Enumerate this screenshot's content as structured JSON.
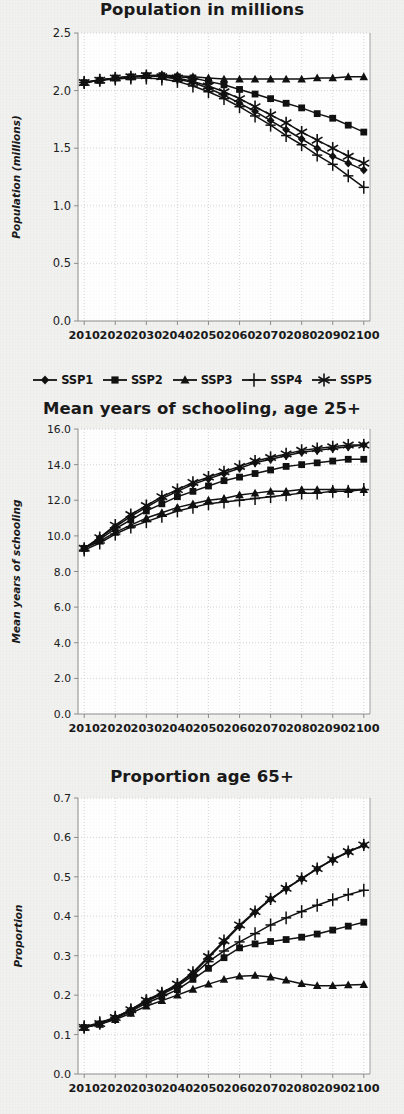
{
  "figure": {
    "background_color": "#f1f1f0",
    "ink_color": "#111111",
    "grid_color": "#c9c9c9",
    "axis_color": "#8d8d8d"
  },
  "legend": {
    "position": "below-first-chart",
    "entries": [
      {
        "label": "SSP1",
        "marker": "diamond"
      },
      {
        "label": "SSP2",
        "marker": "square"
      },
      {
        "label": "SSP3",
        "marker": "triangle"
      },
      {
        "label": "SSP4",
        "marker": "plus"
      },
      {
        "label": "SSP5",
        "marker": "asterisk"
      }
    ]
  },
  "chart_data": [
    {
      "type": "line",
      "title": "Population in millions",
      "xlabel": "",
      "ylabel": "Population (millions)",
      "x": [
        2010,
        2015,
        2020,
        2025,
        2030,
        2035,
        2040,
        2045,
        2050,
        2055,
        2060,
        2065,
        2070,
        2075,
        2080,
        2085,
        2090,
        2095,
        2100
      ],
      "xticks": [
        2010,
        2020,
        2030,
        2040,
        2050,
        2060,
        2070,
        2080,
        2090,
        2100
      ],
      "xlim": [
        2008,
        2102
      ],
      "ylim": [
        0.0,
        2.5
      ],
      "yticks": [
        0.0,
        0.5,
        1.0,
        1.5,
        2.0,
        2.5
      ],
      "ytick_labels": [
        "0.0",
        "0.5",
        "1.0",
        "1.5",
        "2.0",
        "2.5"
      ],
      "grid": true,
      "series": [
        {
          "name": "SSP1",
          "marker": "diamond",
          "values": [
            2.07,
            2.09,
            2.11,
            2.12,
            2.13,
            2.12,
            2.1,
            2.07,
            2.02,
            1.96,
            1.89,
            1.82,
            1.74,
            1.66,
            1.58,
            1.5,
            1.43,
            1.37,
            1.31
          ]
        },
        {
          "name": "SSP2",
          "marker": "square",
          "values": [
            2.07,
            2.09,
            2.11,
            2.12,
            2.13,
            2.13,
            2.12,
            2.11,
            2.08,
            2.05,
            2.01,
            1.97,
            1.93,
            1.89,
            1.85,
            1.8,
            1.76,
            1.7,
            1.64
          ]
        },
        {
          "name": "SSP3",
          "marker": "triangle",
          "values": [
            2.07,
            2.09,
            2.11,
            2.12,
            2.13,
            2.13,
            2.13,
            2.12,
            2.11,
            2.1,
            2.1,
            2.1,
            2.1,
            2.1,
            2.1,
            2.11,
            2.11,
            2.12,
            2.12
          ]
        },
        {
          "name": "SSP4",
          "marker": "plus",
          "values": [
            2.07,
            2.09,
            2.1,
            2.11,
            2.11,
            2.1,
            2.08,
            2.04,
            1.99,
            1.93,
            1.86,
            1.78,
            1.7,
            1.61,
            1.53,
            1.44,
            1.36,
            1.26,
            1.16
          ]
        },
        {
          "name": "SSP5",
          "marker": "asterisk",
          "values": [
            2.07,
            2.09,
            2.11,
            2.12,
            2.13,
            2.12,
            2.11,
            2.08,
            2.04,
            1.99,
            1.93,
            1.86,
            1.79,
            1.72,
            1.64,
            1.57,
            1.5,
            1.43,
            1.37
          ]
        }
      ]
    },
    {
      "type": "line",
      "title": "Mean years of schooling, age 25+",
      "xlabel": "",
      "ylabel": "Mean years of schooling",
      "x": [
        2010,
        2015,
        2020,
        2025,
        2030,
        2035,
        2040,
        2045,
        2050,
        2055,
        2060,
        2065,
        2070,
        2075,
        2080,
        2085,
        2090,
        2095,
        2100
      ],
      "xticks": [
        2010,
        2020,
        2030,
        2040,
        2050,
        2060,
        2070,
        2080,
        2090,
        2100
      ],
      "xlim": [
        2008,
        2102
      ],
      "ylim": [
        0.0,
        16.0
      ],
      "yticks": [
        0.0,
        2.0,
        4.0,
        6.0,
        8.0,
        10.0,
        12.0,
        14.0,
        16.0
      ],
      "ytick_labels": [
        "0.0",
        "2.0",
        "4.0",
        "6.0",
        "8.0",
        "10.0",
        "12.0",
        "14.0",
        "16.0"
      ],
      "grid": true,
      "series": [
        {
          "name": "SSP1",
          "marker": "diamond",
          "values": [
            9.3,
            9.9,
            10.5,
            11.1,
            11.6,
            12.1,
            12.5,
            12.9,
            13.2,
            13.5,
            13.8,
            14.1,
            14.3,
            14.5,
            14.7,
            14.8,
            14.9,
            15.0,
            15.1
          ]
        },
        {
          "name": "SSP2",
          "marker": "square",
          "values": [
            9.3,
            9.8,
            10.4,
            10.9,
            11.4,
            11.8,
            12.2,
            12.5,
            12.8,
            13.1,
            13.3,
            13.5,
            13.7,
            13.9,
            14.0,
            14.1,
            14.2,
            14.3,
            14.3
          ]
        },
        {
          "name": "SSP3",
          "marker": "triangle",
          "values": [
            9.3,
            9.7,
            10.2,
            10.6,
            11.0,
            11.3,
            11.6,
            11.8,
            12.0,
            12.1,
            12.3,
            12.4,
            12.5,
            12.5,
            12.6,
            12.6,
            12.6,
            12.6,
            12.6
          ]
        },
        {
          "name": "SSP4",
          "marker": "plus",
          "values": [
            9.2,
            9.6,
            10.1,
            10.5,
            10.8,
            11.1,
            11.4,
            11.6,
            11.8,
            11.9,
            12.0,
            12.1,
            12.2,
            12.3,
            12.4,
            12.4,
            12.5,
            12.5,
            12.6
          ]
        },
        {
          "name": "SSP5",
          "marker": "asterisk",
          "values": [
            9.3,
            9.9,
            10.6,
            11.2,
            11.7,
            12.2,
            12.6,
            13.0,
            13.3,
            13.6,
            13.9,
            14.2,
            14.4,
            14.6,
            14.8,
            14.9,
            15.0,
            15.1,
            15.1
          ]
        }
      ]
    },
    {
      "type": "line",
      "title": "Proportion age 65+",
      "xlabel": "",
      "ylabel": "Proportion",
      "x": [
        2010,
        2015,
        2020,
        2025,
        2030,
        2035,
        2040,
        2045,
        2050,
        2055,
        2060,
        2065,
        2070,
        2075,
        2080,
        2085,
        2090,
        2095,
        2100
      ],
      "xticks": [
        2010,
        2020,
        2030,
        2040,
        2050,
        2060,
        2070,
        2080,
        2090,
        2100
      ],
      "xlim": [
        2008,
        2102
      ],
      "ylim": [
        0.0,
        0.7
      ],
      "yticks": [
        0.0,
        0.1,
        0.2,
        0.3,
        0.4,
        0.5,
        0.6,
        0.7
      ],
      "ytick_labels": [
        "0.0",
        "0.1",
        "0.2",
        "0.3",
        "0.4",
        "0.5",
        "0.6",
        "0.7"
      ],
      "grid": true,
      "series": [
        {
          "name": "SSP1",
          "marker": "diamond",
          "values": [
            0.118,
            0.128,
            0.143,
            0.163,
            0.186,
            0.205,
            0.225,
            0.255,
            0.295,
            0.335,
            0.375,
            0.41,
            0.443,
            0.47,
            0.495,
            0.52,
            0.543,
            0.563,
            0.58
          ]
        },
        {
          "name": "SSP2",
          "marker": "square",
          "values": [
            0.118,
            0.127,
            0.141,
            0.159,
            0.18,
            0.196,
            0.214,
            0.24,
            0.268,
            0.295,
            0.32,
            0.33,
            0.336,
            0.341,
            0.347,
            0.355,
            0.365,
            0.375,
            0.385
          ]
        },
        {
          "name": "SSP3",
          "marker": "triangle",
          "values": [
            0.118,
            0.126,
            0.138,
            0.154,
            0.172,
            0.186,
            0.2,
            0.215,
            0.228,
            0.24,
            0.248,
            0.25,
            0.246,
            0.238,
            0.229,
            0.224,
            0.224,
            0.226,
            0.227
          ]
        },
        {
          "name": "SSP4",
          "marker": "plus",
          "values": [
            0.12,
            0.13,
            0.144,
            0.162,
            0.184,
            0.202,
            0.222,
            0.25,
            0.285,
            0.312,
            0.335,
            0.356,
            0.378,
            0.396,
            0.412,
            0.428,
            0.442,
            0.455,
            0.466
          ]
        },
        {
          "name": "SSP5",
          "marker": "asterisk",
          "values": [
            0.118,
            0.128,
            0.143,
            0.163,
            0.187,
            0.206,
            0.228,
            0.258,
            0.298,
            0.338,
            0.378,
            0.412,
            0.444,
            0.471,
            0.496,
            0.521,
            0.544,
            0.564,
            0.581
          ]
        }
      ]
    }
  ]
}
